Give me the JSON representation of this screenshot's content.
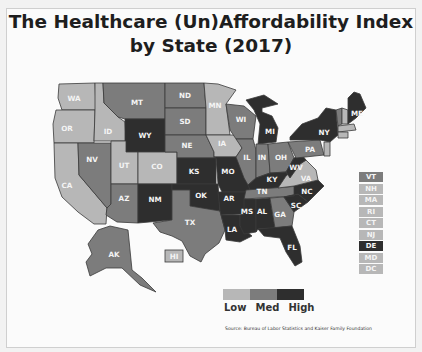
{
  "title": {
    "line1": "The Healthcare (Un)Affordability Index",
    "line2": "by State (2017)"
  },
  "colors": {
    "low": "#b7b7b7",
    "med": "#7c7c7c",
    "high": "#2e2e2e",
    "background": "#fbfbfb"
  },
  "states": {
    "WA": {
      "label": "WA",
      "level": "low"
    },
    "OR": {
      "label": "OR",
      "level": "low"
    },
    "CA": {
      "label": "CA",
      "level": "low"
    },
    "ID": {
      "label": "ID",
      "level": "low"
    },
    "NV": {
      "label": "NV",
      "level": "med"
    },
    "MT": {
      "label": "MT",
      "level": "med"
    },
    "WY": {
      "label": "WY",
      "level": "high"
    },
    "UT": {
      "label": "UT",
      "level": "low"
    },
    "CO": {
      "label": "CO",
      "level": "low"
    },
    "AZ": {
      "label": "AZ",
      "level": "med"
    },
    "NM": {
      "label": "NM",
      "level": "high"
    },
    "ND": {
      "label": "ND",
      "level": "med"
    },
    "SD": {
      "label": "SD",
      "level": "med"
    },
    "NE": {
      "label": "NE",
      "level": "med"
    },
    "KS": {
      "label": "KS",
      "level": "high"
    },
    "OK": {
      "label": "OK",
      "level": "high"
    },
    "TX": {
      "label": "TX",
      "level": "med"
    },
    "MN": {
      "label": "MN",
      "level": "low"
    },
    "IA": {
      "label": "IA",
      "level": "low"
    },
    "MO": {
      "label": "MO",
      "level": "high"
    },
    "AR": {
      "label": "AR",
      "level": "high"
    },
    "LA": {
      "label": "LA",
      "level": "high"
    },
    "WI": {
      "label": "WI",
      "level": "med"
    },
    "IL": {
      "label": "IL",
      "level": "med"
    },
    "MI": {
      "label": "MI",
      "level": "high"
    },
    "IN": {
      "label": "IN",
      "level": "med"
    },
    "OH": {
      "label": "OH",
      "level": "med"
    },
    "KY": {
      "label": "KY",
      "level": "high"
    },
    "TN": {
      "label": "TN",
      "level": "med"
    },
    "MS": {
      "label": "MS",
      "level": "high"
    },
    "AL": {
      "label": "AL",
      "level": "high"
    },
    "GA": {
      "label": "GA",
      "level": "med"
    },
    "FL": {
      "label": "FL",
      "level": "high"
    },
    "SC": {
      "label": "SC",
      "level": "high"
    },
    "NC": {
      "label": "NC",
      "level": "high"
    },
    "VA": {
      "label": "VA",
      "level": "low"
    },
    "WV": {
      "label": "WV",
      "level": "high"
    },
    "PA": {
      "label": "PA",
      "level": "med"
    },
    "NY": {
      "label": "NY",
      "level": "high"
    },
    "ME": {
      "label": "ME",
      "level": "high"
    },
    "AK": {
      "label": "AK",
      "level": "med"
    },
    "HI": {
      "label": "HI",
      "level": "low"
    }
  },
  "northeast_boxes": [
    {
      "label": "VT",
      "level": "med"
    },
    {
      "label": "NH",
      "level": "low"
    },
    {
      "label": "MA",
      "level": "low"
    },
    {
      "label": "RI",
      "level": "low"
    },
    {
      "label": "CT",
      "level": "low"
    },
    {
      "label": "NJ",
      "level": "low"
    },
    {
      "label": "DE",
      "level": "high"
    },
    {
      "label": "MD",
      "level": "low"
    },
    {
      "label": "DC",
      "level": "low"
    }
  ],
  "legend": {
    "items": [
      {
        "label": "Low",
        "level": "low"
      },
      {
        "label": "Med",
        "level": "med"
      },
      {
        "label": "High",
        "level": "high"
      }
    ]
  },
  "source": "Source: Bureau of Labor Statistics and Kaiser Family Foundation"
}
